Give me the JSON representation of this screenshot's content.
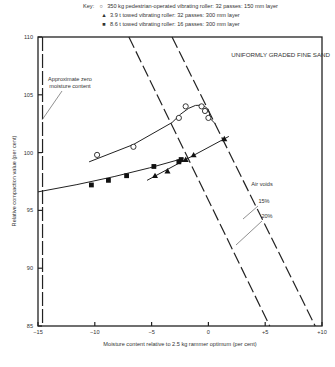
{
  "key": {
    "label": "Key:",
    "entries": [
      {
        "symbol": "open-circle",
        "glyph": "○",
        "text": "350 kg pedestrian-operated vibrating roller: 32 passes: 150 mm layer"
      },
      {
        "symbol": "filled-triangle",
        "glyph": "▲",
        "text": "3.9 t towed vibrating roller: 32 passes: 300 mm layer"
      },
      {
        "symbol": "filled-square",
        "glyph": "■",
        "text": "8.6 t towed vibrating roller: 16 passes: 300 mm layer"
      }
    ]
  },
  "annotations": {
    "title": "UNIFORMLY GRADED FINE SAND",
    "zero_moisture_1": "Approximate zero",
    "zero_moisture_2": "moisture content",
    "air_voids": "Air voids",
    "av15": "15%",
    "av20": "20%"
  },
  "axes": {
    "xlabel": "Moisture content relative to 2.5 kg rammer optimum (per cent)",
    "ylabel": "Relative compaction value (per cent)",
    "xticks": [
      "−15",
      "−10",
      "−5",
      "0",
      "+5",
      "+10"
    ],
    "yticks": [
      "85",
      "90",
      "95",
      "100",
      "105",
      "110"
    ]
  },
  "chart_data": {
    "type": "scatter",
    "title": "UNIFORMLY GRADED FINE SAND",
    "xlabel": "Moisture content relative to 2.5 kg rammer optimum (per cent)",
    "ylabel": "Relative compaction value (per cent)",
    "xlim": [
      -15,
      10
    ],
    "ylim": [
      85,
      110
    ],
    "xticks": [
      -15,
      -10,
      -5,
      0,
      5,
      10
    ],
    "yticks": [
      85,
      90,
      95,
      100,
      105,
      110
    ],
    "grid": false,
    "legend_position": "top (key above plot)",
    "series": [
      {
        "name": "350 kg pedestrian-operated vibrating roller: 32 passes: 150 mm layer",
        "marker": "open-circle",
        "points": [
          [
            -9.8,
            99.8
          ],
          [
            -6.6,
            100.5
          ],
          [
            -2.6,
            103.0
          ],
          [
            -2.0,
            104.0
          ],
          [
            -0.6,
            104.0
          ],
          [
            -0.3,
            103.6
          ],
          [
            0.0,
            103.0
          ]
        ]
      },
      {
        "name": "3.9 t towed vibrating roller: 32 passes: 300 mm layer",
        "marker": "filled-triangle",
        "points": [
          [
            -4.7,
            98.0
          ],
          [
            -3.6,
            98.4
          ],
          [
            -2.0,
            99.4
          ],
          [
            -1.3,
            99.8
          ],
          [
            1.4,
            101.2
          ]
        ]
      },
      {
        "name": "8.6 t towed vibrating roller: 16 passes: 300 mm layer",
        "marker": "filled-square",
        "points": [
          [
            -10.3,
            97.2
          ],
          [
            -8.8,
            97.6
          ],
          [
            -7.2,
            98.0
          ],
          [
            -4.8,
            98.8
          ],
          [
            -2.6,
            99.2
          ],
          [
            -2.4,
            99.4
          ]
        ]
      }
    ],
    "reference_lines": [
      {
        "name": "Approximate zero moisture content",
        "style": "dashed vertical",
        "x": -14.6
      },
      {
        "name": "Air voids 15%",
        "style": "dashed",
        "points": [
          [
            -7.0,
            110
          ],
          [
            5.4,
            85
          ]
        ]
      },
      {
        "name": "Air voids 20%",
        "style": "dashed",
        "points": [
          [
            -3.2,
            110
          ],
          [
            9.4,
            85
          ]
        ]
      }
    ],
    "annotations": [
      "Approximate zero moisture content",
      "Air voids",
      "15%",
      "20%"
    ]
  }
}
